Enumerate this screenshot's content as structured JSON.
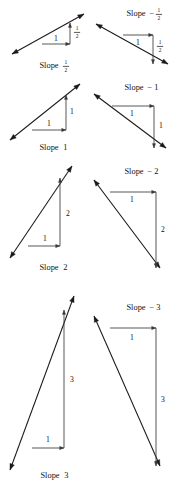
{
  "figure": {
    "width": 171,
    "height": 494,
    "background": "#ffffff",
    "ink_color": "#1a1a1a",
    "leg_color": "#3a3a3a"
  },
  "panels": [
    {
      "id": "slope-one-half",
      "slope_label": "Slope",
      "slope_value_type": "fraction",
      "slope_sign": "",
      "slope_numerator": "1",
      "slope_denominator": "2",
      "slope_plain": "Slope 1/2",
      "direction": "up",
      "run_label": "1",
      "rise_label_type": "fraction",
      "rise_numerator": "1",
      "rise_denominator": "2",
      "rise_plain": "1/2",
      "run": 1,
      "rise": 0.5
    },
    {
      "id": "slope-neg-one-half",
      "slope_label": "Slope",
      "slope_value_type": "fraction",
      "slope_sign": "−",
      "slope_numerator": "1",
      "slope_denominator": "2",
      "slope_plain": "Slope -1/2",
      "direction": "down",
      "run_label": "1",
      "rise_label_type": "fraction",
      "rise_numerator": "1",
      "rise_denominator": "2",
      "rise_plain": "1/2",
      "run": 1,
      "rise": -0.5
    },
    {
      "id": "slope-one",
      "slope_label": "Slope",
      "slope_value_type": "integer",
      "slope_sign": "",
      "slope_number": "1",
      "slope_plain": "Slope 1",
      "direction": "up",
      "run_label": "1",
      "rise_label_type": "integer",
      "rise_number": "1",
      "rise_plain": "1",
      "run": 1,
      "rise": 1
    },
    {
      "id": "slope-neg-one",
      "slope_label": "Slope",
      "slope_value_type": "integer",
      "slope_sign": "−",
      "slope_number": "1",
      "slope_plain": "Slope -1",
      "direction": "down",
      "run_label": "1",
      "rise_label_type": "integer",
      "rise_number": "1",
      "rise_plain": "1",
      "run": 1,
      "rise": -1
    },
    {
      "id": "slope-two",
      "slope_label": "Slope",
      "slope_value_type": "integer",
      "slope_sign": "",
      "slope_number": "2",
      "slope_plain": "Slope 2",
      "direction": "up",
      "run_label": "1",
      "rise_label_type": "integer",
      "rise_number": "2",
      "rise_plain": "2",
      "run": 1,
      "rise": 2
    },
    {
      "id": "slope-neg-two",
      "slope_label": "Slope",
      "slope_value_type": "integer",
      "slope_sign": "−",
      "slope_number": "2",
      "slope_plain": "Slope -2",
      "direction": "down",
      "run_label": "1",
      "rise_label_type": "integer",
      "rise_number": "2",
      "rise_plain": "2",
      "run": 1,
      "rise": -2
    },
    {
      "id": "slope-three",
      "slope_label": "Slope",
      "slope_value_type": "integer",
      "slope_sign": "",
      "slope_number": "3",
      "slope_plain": "Slope 3",
      "direction": "up",
      "run_label": "1",
      "rise_label_type": "integer",
      "rise_number": "3",
      "rise_plain": "3",
      "run": 1,
      "rise": 3
    },
    {
      "id": "slope-neg-three",
      "slope_label": "Slope",
      "slope_value_type": "integer",
      "slope_sign": "−",
      "slope_number": "3",
      "slope_plain": "Slope -3",
      "direction": "down",
      "run_label": "1",
      "rise_label_type": "integer",
      "rise_number": "3",
      "rise_plain": "3",
      "run": 1,
      "rise": -3
    }
  ],
  "layout": {
    "panel_geometry": [
      {
        "id": "slope-one-half",
        "x": 2,
        "y": 2,
        "w": 88,
        "h": 72,
        "line": [
          10,
          52,
          82,
          12
        ],
        "corner": [
          68,
          21
        ],
        "foot": [
          68,
          42
        ],
        "run_start": [
          40,
          42
        ],
        "run_label_pos": [
          54,
          37
        ],
        "rise_label_pos": [
          75,
          30
        ],
        "slope_label_pos": [
          47,
          64
        ]
      },
      {
        "id": "slope-neg-one-half",
        "x": 88,
        "y": 2,
        "w": 83,
        "h": 72,
        "line": [
          8,
          22,
          80,
          62
        ],
        "corner": [
          65,
          33
        ],
        "foot": [
          65,
          54
        ],
        "run_start": [
          35,
          33
        ],
        "run_label_pos": [
          50,
          41
        ],
        "rise_label_pos": [
          72,
          44
        ],
        "slope_label_pos": [
          48,
          12
        ]
      },
      {
        "id": "slope-one",
        "x": 2,
        "y": 78,
        "w": 88,
        "h": 76,
        "line": [
          8,
          62,
          78,
          6
        ],
        "corner": [
          64,
          17
        ],
        "foot": [
          64,
          52
        ],
        "run_start": [
          30,
          52
        ],
        "run_label_pos": [
          47,
          46
        ],
        "rise_label_pos": [
          70,
          34
        ],
        "slope_label_pos": [
          47,
          70
        ]
      },
      {
        "id": "slope-neg-one",
        "x": 88,
        "y": 78,
        "w": 83,
        "h": 76,
        "line": [
          6,
          16,
          78,
          70
        ],
        "corner": [
          24,
          28
        ],
        "foot": [
          66,
          28
        ],
        "run_start": [
          24,
          28
        ],
        "run_label_pos": [
          44,
          36
        ],
        "rise_label_pos": [
          73,
          48
        ],
        "slope_label_pos": [
          46,
          10
        ]
      },
      {
        "id": "slope-two",
        "x": 2,
        "y": 158,
        "w": 88,
        "h": 116,
        "line": [
          8,
          100,
          70,
          8
        ],
        "corner": [
          58,
          20
        ],
        "foot": [
          58,
          88
        ],
        "run_start": [
          26,
          88
        ],
        "run_label_pos": [
          43,
          81
        ],
        "rise_label_pos": [
          66,
          56
        ],
        "slope_label_pos": [
          47,
          110
        ]
      },
      {
        "id": "slope-neg-two",
        "x": 88,
        "y": 158,
        "w": 83,
        "h": 116,
        "line": [
          6,
          22,
          72,
          110
        ],
        "corner": [
          22,
          34
        ],
        "foot": [
          68,
          34
        ],
        "run_start": [
          22,
          34
        ],
        "run_label_pos": [
          44,
          42
        ],
        "rise_label_pos": [
          75,
          72
        ],
        "slope_label_pos": [
          46,
          14
        ]
      },
      {
        "id": "slope-three",
        "x": 2,
        "y": 288,
        "w": 88,
        "h": 200,
        "line": [
          8,
          182,
          72,
          8
        ],
        "corner": [
          62,
          22
        ],
        "foot": [
          62,
          160
        ],
        "run_start": [
          30,
          160
        ],
        "run_label_pos": [
          46,
          152
        ],
        "rise_label_pos": [
          70,
          92
        ],
        "slope_label_pos": [
          48,
          188
        ]
      },
      {
        "id": "slope-neg-three",
        "x": 88,
        "y": 288,
        "w": 83,
        "h": 200,
        "line": [
          6,
          28,
          72,
          178
        ],
        "corner": [
          22,
          40
        ],
        "foot": [
          68,
          40
        ],
        "run_start": [
          22,
          40
        ],
        "run_label_pos": [
          44,
          50
        ],
        "rise_label_pos": [
          75,
          112
        ],
        "slope_label_pos": [
          48,
          20
        ]
      }
    ]
  }
}
